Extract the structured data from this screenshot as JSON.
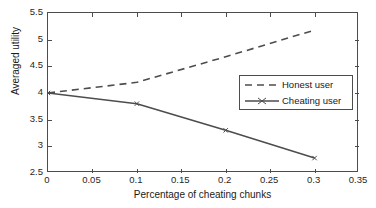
{
  "chart_data": {
    "type": "line",
    "title": "",
    "xlabel": "Percentage of cheating chunks",
    "ylabel": "Averaged utility",
    "xlim": [
      0,
      0.35
    ],
    "ylim": [
      2.5,
      5.5
    ],
    "xticks": [
      "0",
      "0.05",
      "0.1",
      "0.15",
      "0.2",
      "0.25",
      "0.3",
      "0.35"
    ],
    "xtick_values": [
      0,
      0.05,
      0.1,
      0.15,
      0.2,
      0.25,
      0.3,
      0.35
    ],
    "yticks": [
      "5.5",
      "5",
      "4.5",
      "4",
      "3.5",
      "3",
      "2.5"
    ],
    "ytick_values": [
      5.5,
      5,
      4.5,
      4,
      3.5,
      3,
      2.5
    ],
    "grid": false,
    "legend_position": "center-right",
    "series": [
      {
        "name": "Honest user",
        "style": "dashed",
        "color": "#4d4d4d",
        "x": [
          0,
          0.1,
          0.2,
          0.3
        ],
        "values": [
          4.0,
          4.2,
          4.68,
          5.18
        ]
      },
      {
        "name": "Cheating user",
        "style": "solid",
        "color": "#4d4d4d",
        "marker": "cross",
        "x": [
          0,
          0.1,
          0.2,
          0.3
        ],
        "values": [
          4.0,
          3.8,
          3.3,
          2.78
        ]
      }
    ]
  },
  "legend": {
    "items": [
      {
        "label": "Honest user",
        "style": "dashed"
      },
      {
        "label": "Cheating user",
        "style": "solid"
      }
    ]
  },
  "colors": {
    "axis": "#4d4d4d",
    "line": "#4d4d4d",
    "text": "#1a1a1a",
    "background": "#ffffff"
  }
}
